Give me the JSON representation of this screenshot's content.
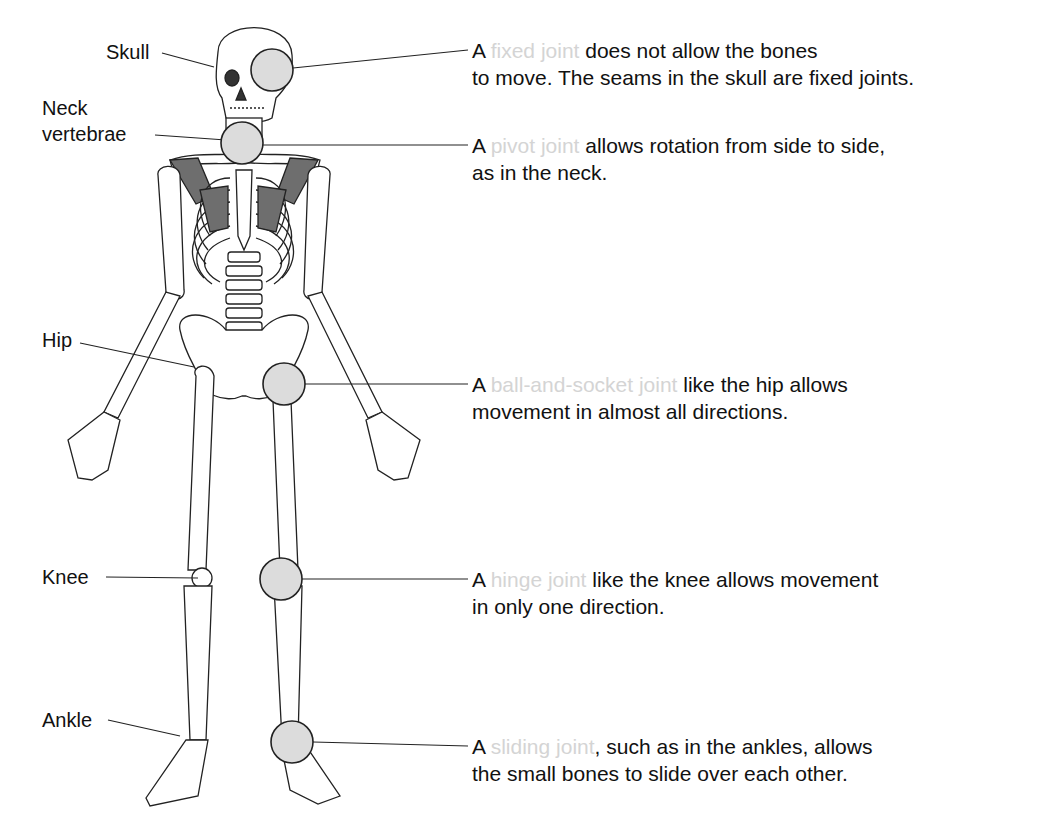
{
  "diagram": {
    "labels": {
      "skull": "Skull",
      "neck_line1": "Neck",
      "neck_line2": "vertebrae",
      "hip": "Hip",
      "knee": "Knee",
      "ankle": "Ankle"
    },
    "descriptions": [
      {
        "prefix": "A ",
        "term": "fixed joint",
        "line1_rest": " does not allow the bones",
        "line2": "to move. The seams in the skull are fixed joints."
      },
      {
        "prefix": "A ",
        "term": "pivot joint",
        "line1_rest": " allows rotation from side to side,",
        "line2": "as in the neck."
      },
      {
        "prefix": "A ",
        "term": "ball-and-socket joint",
        "line1_rest": " like the hip allows",
        "line2": "movement in almost all directions."
      },
      {
        "prefix": "A ",
        "term": "hinge joint",
        "line1_rest": " like the knee allows movement",
        "line2": "in only one direction."
      },
      {
        "prefix": "A ",
        "term": "sliding joint",
        "line1_rest": ", such as in the ankles, allows",
        "line2": "the small bones to slide over each other."
      }
    ],
    "colors": {
      "joint_circle_fill": "#dcdcdc",
      "term_text": "#d4d4d4",
      "shaded_bone": "#707070"
    }
  }
}
